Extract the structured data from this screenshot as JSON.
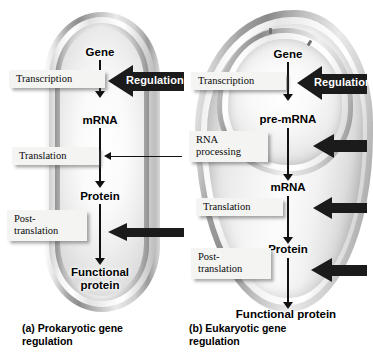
{
  "figure": {
    "colors": {
      "arrow_dark": "#1b1b1b",
      "label_box": "#f4f4f2",
      "text": "#000000",
      "regulation_text": "#ffffff"
    }
  },
  "panel_a": {
    "caption": "(a) Prokaryotic gene\n     regulation",
    "nodes": [
      {
        "label": "Gene"
      },
      {
        "label": "mRNA"
      },
      {
        "label": "Protein"
      },
      {
        "label": "Functional\nprotein"
      }
    ],
    "steps": [
      {
        "label": "Transcription"
      },
      {
        "label": "Translation"
      },
      {
        "label": "Post-\ntranslation"
      }
    ],
    "regulation": {
      "label": "Regulation"
    },
    "arrows": [
      {
        "name": "regulation-block-arrow",
        "style": "block"
      },
      {
        "name": "translation-line-arrow",
        "style": "thin"
      },
      {
        "name": "post-translation-block-arrow",
        "style": "block"
      }
    ]
  },
  "panel_b": {
    "caption": "(b) Eukaryotic gene\n     regulation",
    "nodes": [
      {
        "label": "Gene"
      },
      {
        "label": "pre-mRNA"
      },
      {
        "label": "mRNA"
      },
      {
        "label": "Protein"
      },
      {
        "label": "Functional protein"
      }
    ],
    "steps": [
      {
        "label": "Transcription"
      },
      {
        "label": "RNA\nprocessing"
      },
      {
        "label": "Translation"
      },
      {
        "label": "Post-\ntranslation"
      }
    ],
    "regulation": {
      "label": "Regulation"
    },
    "arrows": [
      {
        "name": "regulation-block-arrow",
        "style": "block"
      },
      {
        "name": "rna-processing-block-arrow",
        "style": "block"
      },
      {
        "name": "translation-block-arrow",
        "style": "block"
      },
      {
        "name": "post-translation-block-arrow",
        "style": "block"
      }
    ]
  }
}
